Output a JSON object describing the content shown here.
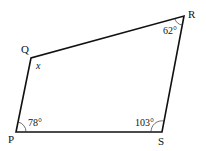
{
  "diagram": {
    "type": "quadrilateral",
    "stroke_color": "#111111",
    "vertices": [
      {
        "name": "P",
        "x": 16,
        "y": 132,
        "label": "P",
        "label_x": 8,
        "label_y": 143
      },
      {
        "name": "Q",
        "x": 31,
        "y": 58,
        "label": "Q",
        "label_x": 21,
        "label_y": 53
      },
      {
        "name": "R",
        "x": 184,
        "y": 16,
        "label": "R",
        "label_x": 188,
        "label_y": 18
      },
      {
        "name": "S",
        "x": 162,
        "y": 132,
        "label": "S",
        "label_x": 158,
        "label_y": 145
      }
    ],
    "angles": [
      {
        "vertex": "P",
        "label": "78°",
        "x": 28,
        "y": 126
      },
      {
        "vertex": "Q",
        "label": "x",
        "x": 36,
        "y": 69,
        "italic": true
      },
      {
        "vertex": "R",
        "label": "62°",
        "x": 163,
        "y": 34
      },
      {
        "vertex": "S",
        "label": "103°",
        "x": 135,
        "y": 126
      }
    ]
  }
}
